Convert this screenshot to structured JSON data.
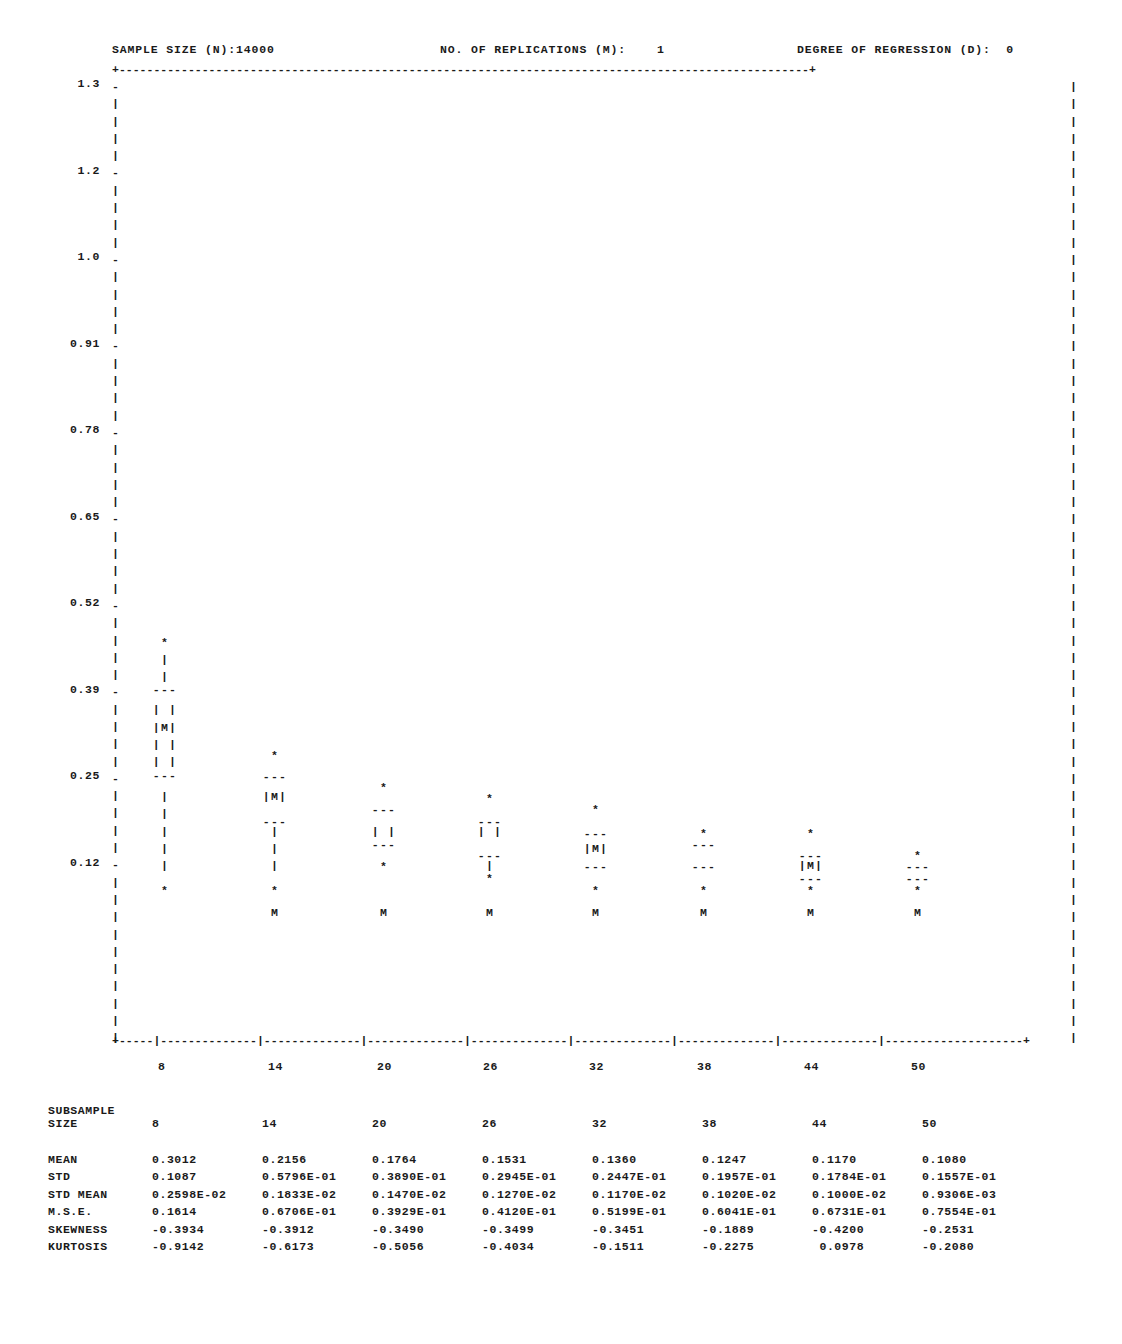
{
  "header": {
    "sample_size_label": "SAMPLE SIZE (N):14000",
    "replications_label": "NO. OF REPLICATIONS (M):    1",
    "degree_label": "DEGREE OF REGRESSION (D):  0"
  },
  "frame": {
    "top_rule": "+----------------------------------------------------------------------------------------------------+",
    "bottom_rule": "+-----|--------------|--------------|--------------|--------------|--------------|--------------|--------------|--------------------+",
    "left_edge_tick": "-",
    "left_edge_bar": "|",
    "right_edge_bar": "|"
  },
  "chart_data": {
    "type": "box",
    "title": "SAMPLE SIZE (N):14000",
    "xlabel": "SUBSAMPLE SIZE",
    "ylabel": "",
    "grid": false,
    "legend": "none",
    "ylim": [
      0.0,
      1.365
    ],
    "ytick_labels": [
      "1.3",
      "1.2",
      "1.0",
      "0.91",
      "0.78",
      "0.65",
      "0.52",
      "0.39",
      "0.25",
      "0.12"
    ],
    "ytick_values": [
      1.3,
      1.2,
      1.0,
      0.91,
      0.78,
      0.65,
      0.52,
      0.39,
      0.25,
      0.12
    ],
    "categories": [
      "8",
      "14",
      "20",
      "26",
      "32",
      "38",
      "44",
      "50"
    ],
    "xtick_labels": [
      "8",
      "14",
      "20",
      "26",
      "32",
      "38",
      "44",
      "50"
    ],
    "boxes": [
      {
        "category": "8",
        "upper_whisker": 0.466,
        "q3": 0.394,
        "box_top_mark": 0.342,
        "median": 0.325,
        "q1": 0.256,
        "lower_whisker": 0.083,
        "outlier_symbol": "*",
        "median_symbol": "M"
      },
      {
        "category": "14",
        "upper_whisker": 0.289,
        "q3": 0.255,
        "median": 0.221,
        "q1": 0.186,
        "lower_whisker": 0.083,
        "extreme": 0.049,
        "outlier_symbol": "*",
        "median_symbol": "M"
      },
      {
        "category": "20",
        "upper_whisker": 0.238,
        "q3": 0.204,
        "median": 0.187,
        "q1": 0.152,
        "lower_whisker": 0.118,
        "extreme": 0.049,
        "outlier_symbol": "*",
        "median_symbol": "M"
      },
      {
        "category": "26",
        "upper_whisker": 0.221,
        "q3": 0.187,
        "median": 0.152,
        "q1": 0.135,
        "lower_whisker": 0.1,
        "extreme": 0.049,
        "outlier_symbol": "*",
        "median_symbol": "M"
      },
      {
        "category": "32",
        "upper_whisker": 0.204,
        "q3": 0.169,
        "median": 0.135,
        "q1": 0.118,
        "lower_whisker": 0.083,
        "extreme": 0.049,
        "outlier_symbol": "*",
        "median_symbol": "M"
      },
      {
        "category": "38",
        "upper_whisker": 0.169,
        "q3": 0.152,
        "median": 0.135,
        "q1": 0.118,
        "lower_whisker": 0.083,
        "extreme": 0.049,
        "outlier_symbol": "*",
        "median_symbol": "M"
      },
      {
        "category": "44",
        "upper_whisker": 0.169,
        "q3": 0.135,
        "median": 0.118,
        "q1": 0.1,
        "lower_whisker": 0.083,
        "extreme": 0.049,
        "outlier_symbol": "*",
        "median_symbol": "M"
      },
      {
        "category": "50",
        "upper_whisker": 0.135,
        "q3": 0.118,
        "median": 0.109,
        "q1": 0.1,
        "lower_whisker": 0.083,
        "extreme": 0.049,
        "outlier_symbol": "*",
        "median_symbol": "M"
      }
    ]
  },
  "stats": {
    "subsample_word": "SUBSAMPLE",
    "size_word": "SIZE",
    "columns": [
      "8",
      "14",
      "20",
      "26",
      "32",
      "38",
      "44",
      "50"
    ],
    "rows": [
      {
        "label": "MEAN",
        "values": [
          "0.3012",
          "0.2156",
          "0.1764",
          "0.1531",
          "0.1360",
          "0.1247",
          "0.1170",
          "0.1080"
        ]
      },
      {
        "label": "STD",
        "values": [
          "0.1087",
          "0.5796E-01",
          "0.3890E-01",
          "0.2945E-01",
          "0.2447E-01",
          "0.1957E-01",
          "0.1784E-01",
          "0.1557E-01"
        ]
      },
      {
        "label": "STD MEAN",
        "values": [
          "0.2598E-02",
          "0.1833E-02",
          "0.1470E-02",
          "0.1270E-02",
          "0.1170E-02",
          "0.1020E-02",
          "0.1000E-02",
          "0.9306E-03"
        ]
      },
      {
        "label": "M.S.E.",
        "values": [
          "0.1614",
          "0.6706E-01",
          "0.3929E-01",
          "0.4120E-01",
          "0.5199E-01",
          "0.6041E-01",
          "0.6731E-01",
          "0.7554E-01"
        ]
      },
      {
        "label": "SKEWNESS",
        "values": [
          "-0.3934",
          "-0.3912",
          "-0.3490",
          "-0.3499",
          "-0.3451",
          "-0.1889",
          "-0.4200",
          "-0.2531"
        ]
      },
      {
        "label": "KURTOSIS",
        "values": [
          "-0.9142",
          "-0.6173",
          "-0.5056",
          "-0.4034",
          "-0.1511",
          "-0.2275",
          " 0.0978",
          "-0.2080"
        ]
      }
    ]
  },
  "layout": {
    "row_height": 17.3,
    "plot_top": 78,
    "plot_rows": 56,
    "column_x": [
      165,
      275,
      384,
      490,
      596,
      704,
      811,
      918
    ],
    "ytick_rows": [
      0,
      5,
      10,
      15,
      20,
      25,
      30,
      35,
      40,
      45
    ]
  },
  "colors": {
    "ink": "#1a1a1a",
    "paper": "#ffffff"
  }
}
